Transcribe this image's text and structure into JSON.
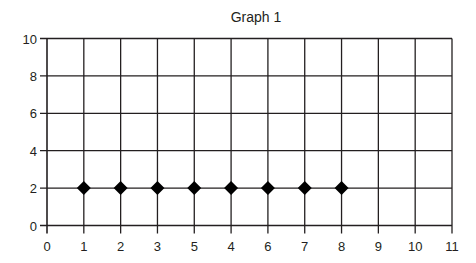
{
  "chart_data": {
    "type": "scatter",
    "title": "Graph 1",
    "xlabel": "",
    "ylabel": "",
    "x_tick_labels": [
      "0",
      "1",
      "2",
      "3",
      "5",
      "4",
      "6",
      "7",
      "8",
      "9",
      "10",
      "11"
    ],
    "y_tick_labels": [
      "0",
      "2",
      "4",
      "6",
      "8",
      "10"
    ],
    "xlim": [
      0,
      11
    ],
    "ylim": [
      0,
      10
    ],
    "grid": true,
    "legend": null,
    "series": [
      {
        "name": "Series 1",
        "marker": "diamond",
        "color": "#000000",
        "points": [
          {
            "x_pos": 1,
            "x_label": "1",
            "y": 2
          },
          {
            "x_pos": 2,
            "x_label": "2",
            "y": 2
          },
          {
            "x_pos": 3,
            "x_label": "3",
            "y": 2
          },
          {
            "x_pos": 4,
            "x_label": "5",
            "y": 2
          },
          {
            "x_pos": 5,
            "x_label": "4",
            "y": 2
          },
          {
            "x_pos": 6,
            "x_label": "6",
            "y": 2
          },
          {
            "x_pos": 7,
            "x_label": "7",
            "y": 2
          },
          {
            "x_pos": 8,
            "x_label": "8",
            "y": 2
          }
        ]
      }
    ]
  },
  "colors": {
    "axis": "#231f20",
    "marker": "#000000",
    "background": "#ffffff"
  }
}
